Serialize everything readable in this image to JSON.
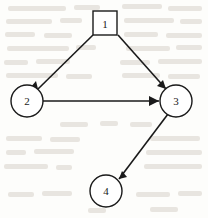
{
  "figure": {
    "type": "directed-graph",
    "width": 208,
    "height": 218,
    "background_color": "#fdfdfb",
    "ink_color": "#1a1a1a",
    "bleed_color": "#d8d2ca"
  },
  "nodes": [
    {
      "id": "1",
      "label": "1",
      "shape": "square",
      "cx": 105,
      "cy": 23,
      "half": 12,
      "label_x": 105,
      "label_y": 24
    },
    {
      "id": "2",
      "label": "2",
      "shape": "circle",
      "cx": 27,
      "cy": 101,
      "r": 16,
      "label_x": 27,
      "label_y": 101
    },
    {
      "id": "3",
      "label": "3",
      "shape": "circle",
      "cx": 176,
      "cy": 101,
      "r": 16,
      "label_x": 176,
      "label_y": 101
    },
    {
      "id": "4",
      "label": "4",
      "shape": "circle",
      "cx": 106,
      "cy": 191,
      "r": 16,
      "label_x": 106,
      "label_y": 191
    }
  ],
  "edges": [
    {
      "id": "edge-1-2",
      "from": "1",
      "to": "2",
      "directed": true,
      "x1": 93,
      "y1": 35,
      "x2": 38,
      "y2": 89,
      "head_points": "38,89 30,88 36,81"
    },
    {
      "id": "edge-1-3",
      "from": "1",
      "to": "3",
      "directed": true,
      "x1": 118,
      "y1": 35,
      "x2": 166,
      "y2": 89,
      "head_points": "166,89 157,86 163,80"
    },
    {
      "id": "edge-2-3",
      "from": "2",
      "to": "3",
      "directed": true,
      "x1": 43,
      "y1": 101,
      "x2": 159,
      "y2": 101,
      "head_points": "159,101 149,96 149,106"
    },
    {
      "id": "edge-3-4",
      "from": "3",
      "to": "4",
      "directed": true,
      "x1": 168,
      "y1": 114,
      "x2": 119,
      "y2": 179,
      "head_points": "119,179 127,177 122,171"
    }
  ],
  "background_bleed": [
    {
      "x": 8,
      "y": 6,
      "w": 58
    },
    {
      "x": 74,
      "y": 5,
      "w": 26
    },
    {
      "x": 122,
      "y": 4,
      "w": 40
    },
    {
      "x": 168,
      "y": 6,
      "w": 34
    },
    {
      "x": 6,
      "y": 19,
      "w": 46
    },
    {
      "x": 60,
      "y": 18,
      "w": 22
    },
    {
      "x": 124,
      "y": 18,
      "w": 50
    },
    {
      "x": 180,
      "y": 19,
      "w": 22
    },
    {
      "x": 5,
      "y": 32,
      "w": 30
    },
    {
      "x": 44,
      "y": 33,
      "w": 28
    },
    {
      "x": 124,
      "y": 32,
      "w": 34
    },
    {
      "x": 166,
      "y": 33,
      "w": 36
    },
    {
      "x": 7,
      "y": 46,
      "w": 62
    },
    {
      "x": 76,
      "y": 45,
      "w": 20
    },
    {
      "x": 126,
      "y": 46,
      "w": 44
    },
    {
      "x": 176,
      "y": 45,
      "w": 26
    },
    {
      "x": 4,
      "y": 60,
      "w": 24
    },
    {
      "x": 36,
      "y": 59,
      "w": 34
    },
    {
      "x": 120,
      "y": 60,
      "w": 30
    },
    {
      "x": 158,
      "y": 59,
      "w": 44
    },
    {
      "x": 6,
      "y": 73,
      "w": 52
    },
    {
      "x": 66,
      "y": 74,
      "w": 26
    },
    {
      "x": 122,
      "y": 73,
      "w": 38
    },
    {
      "x": 168,
      "y": 74,
      "w": 32
    },
    {
      "x": 60,
      "y": 122,
      "w": 28
    },
    {
      "x": 100,
      "y": 121,
      "w": 18
    },
    {
      "x": 130,
      "y": 122,
      "w": 22
    },
    {
      "x": 6,
      "y": 136,
      "w": 36
    },
    {
      "x": 50,
      "y": 137,
      "w": 30
    },
    {
      "x": 150,
      "y": 136,
      "w": 50
    },
    {
      "x": 6,
      "y": 150,
      "w": 20
    },
    {
      "x": 34,
      "y": 149,
      "w": 40
    },
    {
      "x": 146,
      "y": 150,
      "w": 56
    },
    {
      "x": 4,
      "y": 164,
      "w": 44
    },
    {
      "x": 56,
      "y": 165,
      "w": 16
    },
    {
      "x": 144,
      "y": 164,
      "w": 58
    },
    {
      "x": 8,
      "y": 192,
      "w": 26
    },
    {
      "x": 42,
      "y": 191,
      "w": 30
    },
    {
      "x": 136,
      "y": 192,
      "w": 34
    },
    {
      "x": 178,
      "y": 191,
      "w": 24
    },
    {
      "x": 88,
      "y": 208,
      "w": 18
    },
    {
      "x": 150,
      "y": 207,
      "w": 28
    }
  ]
}
